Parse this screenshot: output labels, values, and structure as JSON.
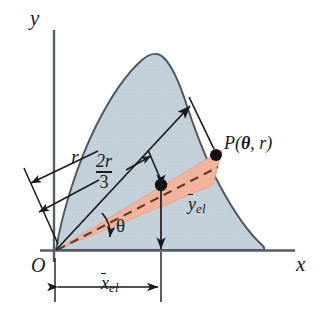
{
  "figure": {
    "kind": "polar-element-centroid-diagram",
    "axes": {
      "y_label": "y",
      "x_label": "x",
      "origin_label": "O"
    },
    "labels": {
      "radius": "r",
      "centroid_distance_numerator": "2r",
      "centroid_distance_denominator": "3",
      "angle": "θ",
      "point_prefix": "P(",
      "point_theta": "θ",
      "point_comma": ", ",
      "point_r": "r",
      "point_suffix": ")",
      "y_bar": "y",
      "y_bar_sub": "el",
      "x_bar": "x",
      "x_bar_sub": "el"
    },
    "colors": {
      "area_fill": "#c3d0da",
      "area_stroke": "#4a5560",
      "element_fill": "#f2b49c",
      "element_stroke": "#e19a82",
      "line": "#1a1a1a",
      "axis": "#555e66",
      "background": "#ffffff"
    }
  }
}
